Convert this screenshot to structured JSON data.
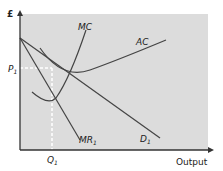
{
  "diagram": {
    "y_axis": {
      "label": "£"
    },
    "x_axis": {
      "label": "Output"
    },
    "price_label": {
      "main": "P",
      "sub": "1"
    },
    "quantity_label": {
      "main": "Q",
      "sub": "1"
    },
    "curves": [
      {
        "name": "MC",
        "main": "MC",
        "sub": ""
      },
      {
        "name": "AC",
        "main": "AC",
        "sub": ""
      },
      {
        "name": "MR",
        "main": "MR",
        "sub": "1"
      },
      {
        "name": "D",
        "main": "D",
        "sub": "1"
      }
    ],
    "colors": {
      "plot_background": "#dcdcdc",
      "curve": "#444444",
      "axis": "#333333",
      "guide_dashed": "#ffffff"
    }
  }
}
